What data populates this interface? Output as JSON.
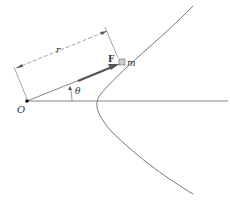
{
  "diagram": {
    "labels": {
      "origin": "O",
      "radius": "r",
      "force": "F",
      "mass": "m",
      "angle": "θ"
    },
    "colors": {
      "line": "#555555",
      "force_arrow": "#555555",
      "mass_fill": "#cccccc"
    }
  }
}
